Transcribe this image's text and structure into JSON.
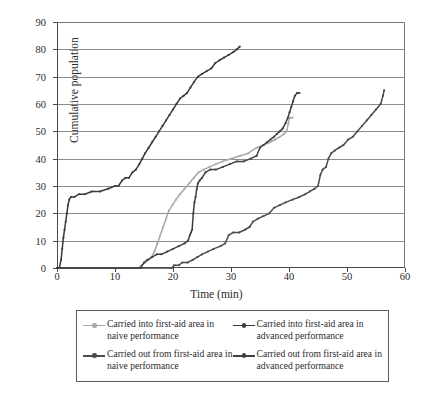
{
  "chart_data": {
    "type": "line",
    "title": "",
    "xlabel": "Time (min)",
    "ylabel": "Cumulative population",
    "xlim": [
      0,
      60
    ],
    "ylim": [
      0,
      90
    ],
    "xticks": [
      0,
      10,
      20,
      30,
      40,
      50,
      60
    ],
    "yticks": [
      0,
      10,
      20,
      30,
      40,
      50,
      60,
      70,
      80,
      90
    ],
    "grid": "horizontal",
    "legend_position": "below-plot",
    "series": [
      {
        "name": "Carried into first-aid area in naive performance",
        "color": "#a8a8a8",
        "marker": "small-dot",
        "points": [
          [
            0,
            0
          ],
          [
            14.0,
            0
          ],
          [
            14.6,
            1
          ],
          [
            15.2,
            2
          ],
          [
            15.8,
            3
          ],
          [
            16.3,
            4
          ],
          [
            16.8,
            6
          ],
          [
            17.3,
            9
          ],
          [
            17.8,
            12
          ],
          [
            18.3,
            15
          ],
          [
            18.8,
            18
          ],
          [
            19.3,
            21
          ],
          [
            19.9,
            23
          ],
          [
            20.5,
            25
          ],
          [
            21.2,
            27
          ],
          [
            22.0,
            29
          ],
          [
            22.8,
            31
          ],
          [
            23.6,
            33
          ],
          [
            24.4,
            35
          ],
          [
            25.3,
            36
          ],
          [
            26.3,
            37
          ],
          [
            27.4,
            38
          ],
          [
            28.6,
            39
          ],
          [
            30.0,
            40
          ],
          [
            31.5,
            41
          ],
          [
            33.0,
            42
          ],
          [
            34.4,
            44
          ],
          [
            35.6,
            45
          ],
          [
            36.7,
            46
          ],
          [
            37.6,
            47
          ],
          [
            38.4,
            48
          ],
          [
            39.1,
            49
          ],
          [
            39.6,
            50
          ],
          [
            39.9,
            53
          ],
          [
            40.1,
            55
          ],
          [
            40.6,
            55
          ]
        ]
      },
      {
        "name": "Carried into first-aid area in advanced performance",
        "color": "#3a3a3a",
        "marker": "small-dot",
        "points": [
          [
            0.4,
            0
          ],
          [
            0.7,
            3
          ],
          [
            0.9,
            7
          ],
          [
            1.1,
            11
          ],
          [
            1.3,
            14
          ],
          [
            1.5,
            17
          ],
          [
            1.7,
            20
          ],
          [
            1.9,
            23
          ],
          [
            2.1,
            25
          ],
          [
            2.4,
            26
          ],
          [
            3.0,
            26
          ],
          [
            3.8,
            27
          ],
          [
            4.8,
            27
          ],
          [
            6.0,
            28
          ],
          [
            7.4,
            28
          ],
          [
            8.8,
            29
          ],
          [
            10.0,
            30
          ],
          [
            10.6,
            30
          ],
          [
            11.2,
            32
          ],
          [
            11.8,
            33
          ],
          [
            12.4,
            33
          ],
          [
            13.0,
            35
          ],
          [
            13.6,
            36
          ],
          [
            14.2,
            38
          ],
          [
            14.7,
            40
          ],
          [
            15.2,
            42
          ],
          [
            15.8,
            44
          ],
          [
            16.4,
            46
          ],
          [
            17.0,
            48
          ],
          [
            17.6,
            50
          ],
          [
            18.2,
            52
          ],
          [
            18.8,
            54
          ],
          [
            19.4,
            56
          ],
          [
            20.0,
            58
          ],
          [
            20.6,
            60
          ],
          [
            21.2,
            62
          ],
          [
            21.8,
            63
          ],
          [
            22.4,
            64
          ],
          [
            23.0,
            66
          ],
          [
            23.6,
            68
          ],
          [
            24.3,
            70
          ],
          [
            25.0,
            71
          ],
          [
            25.8,
            72
          ],
          [
            26.6,
            73
          ],
          [
            27.3,
            75
          ],
          [
            28.0,
            76
          ],
          [
            28.8,
            77
          ],
          [
            29.6,
            78
          ],
          [
            30.4,
            79
          ],
          [
            31.0,
            80
          ],
          [
            31.5,
            81
          ]
        ]
      },
      {
        "name": "Carried out from first-aid area in naive performance",
        "color": "#4a4a4a",
        "marker": "small-dot",
        "points": [
          [
            0,
            0
          ],
          [
            19.8,
            0
          ],
          [
            20.2,
            1
          ],
          [
            21.0,
            1
          ],
          [
            21.6,
            2
          ],
          [
            22.5,
            2
          ],
          [
            23.4,
            3
          ],
          [
            24.2,
            4
          ],
          [
            25.0,
            5
          ],
          [
            26.0,
            6
          ],
          [
            27.0,
            7
          ],
          [
            28.2,
            8
          ],
          [
            29.0,
            9
          ],
          [
            29.6,
            12
          ],
          [
            30.4,
            13
          ],
          [
            31.4,
            13
          ],
          [
            32.4,
            14
          ],
          [
            33.2,
            15
          ],
          [
            33.8,
            17
          ],
          [
            34.6,
            18
          ],
          [
            35.6,
            19
          ],
          [
            36.6,
            20
          ],
          [
            37.4,
            22
          ],
          [
            38.4,
            23
          ],
          [
            39.4,
            24
          ],
          [
            40.6,
            25
          ],
          [
            41.8,
            26
          ],
          [
            42.8,
            27
          ],
          [
            43.6,
            28
          ],
          [
            44.4,
            29
          ],
          [
            45.0,
            30
          ],
          [
            45.4,
            34
          ],
          [
            45.8,
            36
          ],
          [
            46.4,
            37
          ],
          [
            46.8,
            40
          ],
          [
            47.3,
            42
          ],
          [
            47.9,
            43
          ],
          [
            48.6,
            44
          ],
          [
            49.4,
            45
          ],
          [
            50.2,
            47
          ],
          [
            51.0,
            48
          ],
          [
            51.8,
            50
          ],
          [
            52.6,
            52
          ],
          [
            53.4,
            54
          ],
          [
            54.2,
            56
          ],
          [
            55.0,
            58
          ],
          [
            55.8,
            60
          ],
          [
            56.2,
            63
          ],
          [
            56.4,
            65
          ]
        ]
      },
      {
        "name": "Carried out from first-aid area in advanced performance",
        "color": "#3f3f3f",
        "marker": "small-dot",
        "points": [
          [
            0,
            0
          ],
          [
            14.4,
            0
          ],
          [
            15.0,
            2
          ],
          [
            15.6,
            3
          ],
          [
            16.4,
            4
          ],
          [
            17.2,
            5
          ],
          [
            18.0,
            5
          ],
          [
            19.0,
            6
          ],
          [
            20.0,
            7
          ],
          [
            21.0,
            8
          ],
          [
            22.0,
            9
          ],
          [
            22.6,
            10
          ],
          [
            22.9,
            12
          ],
          [
            23.1,
            13
          ],
          [
            23.3,
            14
          ],
          [
            23.5,
            20
          ],
          [
            23.7,
            24
          ],
          [
            23.9,
            26
          ],
          [
            24.1,
            29
          ],
          [
            24.3,
            31
          ],
          [
            24.6,
            32
          ],
          [
            25.0,
            33
          ],
          [
            25.6,
            35
          ],
          [
            26.4,
            36
          ],
          [
            27.4,
            36
          ],
          [
            28.6,
            37
          ],
          [
            29.8,
            38
          ],
          [
            31.0,
            39
          ],
          [
            32.2,
            39
          ],
          [
            33.4,
            40
          ],
          [
            34.4,
            41
          ],
          [
            35.0,
            44
          ],
          [
            35.6,
            45
          ],
          [
            36.2,
            46
          ],
          [
            36.8,
            47
          ],
          [
            37.4,
            48
          ],
          [
            37.9,
            49
          ],
          [
            38.4,
            50
          ],
          [
            38.9,
            51
          ],
          [
            39.4,
            53
          ],
          [
            39.8,
            55
          ],
          [
            40.1,
            57
          ],
          [
            40.4,
            59
          ],
          [
            40.7,
            61
          ],
          [
            41.0,
            63
          ],
          [
            41.4,
            64
          ],
          [
            41.8,
            64
          ]
        ]
      }
    ]
  },
  "legend": {
    "items": [
      {
        "label": "Carried into first-aid area in naive performance",
        "color": "#a8a8a8",
        "marker_name": "line-dot-marker-light"
      },
      {
        "label": "Carried into first-aid area in advanced performance",
        "color": "#3a3a3a",
        "marker_name": "line-dot-marker-dark"
      },
      {
        "label": "Carried out from first-aid area in naive performance",
        "color": "#4a4a4a",
        "marker_name": "line-dot-marker-dark"
      },
      {
        "label": "Carried out from first-aid area in advanced performance",
        "color": "#3f3f3f",
        "marker_name": "line-dot-marker-dark"
      }
    ]
  },
  "colors": {
    "grid": "#8c8c8c",
    "axis": "#4a4a4a",
    "text": "#2b2b2b",
    "background": "#ffffff"
  }
}
